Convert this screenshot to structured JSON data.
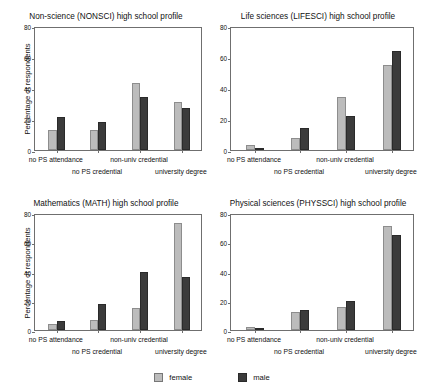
{
  "figure": {
    "ylabel": "Percentage of respondents",
    "categories": [
      "no PS attendance",
      "no PS credential",
      "non-univ credential",
      "university degree"
    ],
    "ytick_labels": [
      "0",
      "20",
      "40",
      "60",
      "80"
    ],
    "ylim": [
      0,
      80
    ],
    "colors": {
      "female": "#bcbcbc",
      "male": "#3b3b3b"
    }
  },
  "legend": {
    "position": "bottom-center",
    "items": [
      {
        "label": "female",
        "key": "female"
      },
      {
        "label": "male",
        "key": "male"
      }
    ]
  },
  "chart_data": [
    {
      "type": "bar",
      "title": "Non-science (NONSCI) high school profile",
      "xlabel": "",
      "ylabel": "Percentage of respondents",
      "ylim": [
        0,
        80
      ],
      "yticks": [
        0,
        20,
        40,
        60,
        80
      ],
      "grid": false,
      "categories": [
        "no PS attendance",
        "no PS credential",
        "non-univ credential",
        "university degree"
      ],
      "series": [
        {
          "name": "female",
          "values": [
            13,
            13,
            43,
            31
          ]
        },
        {
          "name": "male",
          "values": [
            21,
            18,
            34,
            27
          ]
        }
      ]
    },
    {
      "type": "bar",
      "title": "Life sciences (LIFESCI) high school profile",
      "xlabel": "",
      "ylabel": "",
      "ylim": [
        0,
        80
      ],
      "yticks": [
        0,
        20,
        40,
        60,
        80
      ],
      "grid": false,
      "categories": [
        "no PS attendance",
        "no PS credential",
        "non-univ credential",
        "university degree"
      ],
      "series": [
        {
          "name": "female",
          "values": [
            3,
            8,
            34,
            55
          ]
        },
        {
          "name": "male",
          "values": [
            1.5,
            14,
            22,
            64
          ]
        }
      ]
    },
    {
      "type": "bar",
      "title": "Mathematics (MATH) high school profile",
      "xlabel": "",
      "ylabel": "Percentage of respondents",
      "ylim": [
        0,
        80
      ],
      "yticks": [
        0,
        20,
        40,
        60,
        80
      ],
      "grid": false,
      "categories": [
        "no PS attendance",
        "no PS credential",
        "non-univ credential",
        "university degree"
      ],
      "series": [
        {
          "name": "female",
          "values": [
            4,
            7,
            15,
            73
          ]
        },
        {
          "name": "male",
          "values": [
            6,
            18,
            40,
            36
          ]
        }
      ]
    },
    {
      "type": "bar",
      "title": "Physical sciences (PHYSSCI) high school profile",
      "xlabel": "",
      "ylabel": "",
      "ylim": [
        0,
        80
      ],
      "yticks": [
        0,
        20,
        40,
        60,
        80
      ],
      "grid": false,
      "categories": [
        "no PS attendance",
        "no PS credential",
        "non-univ credential",
        "university degree"
      ],
      "series": [
        {
          "name": "female",
          "values": [
            2,
            12,
            16,
            71
          ]
        },
        {
          "name": "male",
          "values": [
            1.5,
            14,
            20,
            65
          ]
        }
      ]
    }
  ]
}
